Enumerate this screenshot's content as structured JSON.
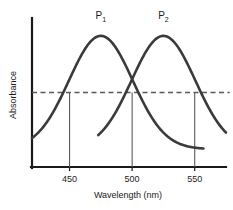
{
  "chart_data": {
    "type": "line",
    "title": "",
    "xlabel": "Wavelength (nm)",
    "ylabel": "Absorbance",
    "xlim": [
      420,
      575
    ],
    "ylim": [
      0,
      1
    ],
    "xticks": [
      450,
      500,
      550
    ],
    "xtick_labels": [
      "450",
      "500",
      "550"
    ],
    "yticks": [],
    "ytick_labels": [],
    "grid": false,
    "legend": false,
    "curve_color": "#3a3a3a",
    "axis_color": "#1a1a1a",
    "guide_color": "#5a5a5a",
    "series": [
      {
        "name": "P1",
        "label": "P",
        "subscript": "1",
        "peak_wavelength": 475,
        "peak_absorbance": 0.88,
        "half_width": 30,
        "baseline": 0.12,
        "x_start": 420,
        "x_end": 557,
        "label_x": 475,
        "label_y": 0.99
      },
      {
        "name": "P2",
        "label": "P",
        "subscript": "2",
        "peak_wavelength": 525,
        "peak_absorbance": 0.88,
        "half_width": 30,
        "baseline": 0.12,
        "x_start": 473,
        "x_end": 575,
        "label_x": 525,
        "label_y": 0.99
      }
    ],
    "reference_line": {
      "name": "isosbestic-absorbance-level",
      "absorbance": 0.5,
      "style": "dashed",
      "x_start": 420,
      "x_end": 578
    },
    "drop_lines": [
      {
        "wavelength": 450,
        "from_absorbance": 0.5,
        "to_absorbance": 0
      },
      {
        "wavelength": 500,
        "from_absorbance": 0.5,
        "to_absorbance": 0
      },
      {
        "wavelength": 550,
        "from_absorbance": 0.5,
        "to_absorbance": 0
      }
    ]
  }
}
